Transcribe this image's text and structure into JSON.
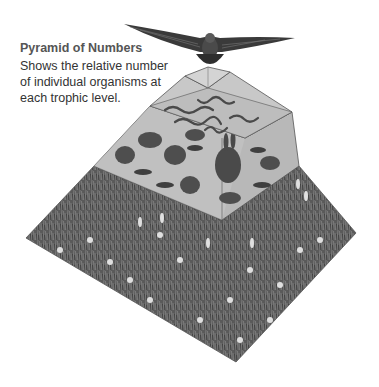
{
  "caption": {
    "title": "Pyramid of Numbers",
    "description": "Shows the relative number of individual organisms at each trophic level."
  },
  "pyramid": {
    "levels": [
      {
        "name": "hawk",
        "label": "Tertiary consumer",
        "count": 1
      },
      {
        "name": "snakes",
        "label": "Secondary consumers"
      },
      {
        "name": "mice-rabbits-grasshoppers",
        "label": "Primary consumers"
      },
      {
        "name": "grass-and-flowers",
        "label": "Producers"
      }
    ]
  },
  "colors": {
    "grass_dark": "#4a4a4a",
    "grass_mid": "#6e6e6e",
    "tier_light": "#cfcfcf",
    "tier_face": "#bdbdbd",
    "edge": "#555555"
  }
}
